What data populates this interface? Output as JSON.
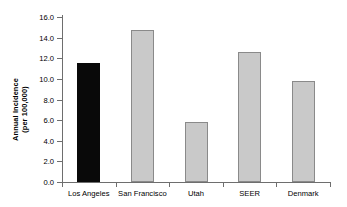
{
  "chart_data": {
    "type": "bar",
    "title": "",
    "xlabel": "",
    "ylabel": "Annual Incidence (per 100,000)",
    "ylabel_line1": "Annual Incidence",
    "ylabel_line2": "(per 100,000)",
    "categories": [
      "Los Angeles",
      "San Francisco",
      "Utah",
      "SEER",
      "Denmark"
    ],
    "values": [
      11.5,
      14.7,
      5.8,
      12.6,
      9.8
    ],
    "series": [
      {
        "name": "Annual Incidence (per 100,000)",
        "values": [
          11.5,
          14.7,
          5.8,
          12.6,
          9.8
        ]
      }
    ],
    "highlighted_category": "Los Angeles",
    "bar_colors": [
      "#090909",
      "#c9c9c9",
      "#c9c9c9",
      "#c9c9c9",
      "#c9c9c9"
    ],
    "bar_border_color": "#8a8a8a",
    "ylim": [
      0.0,
      16.0
    ],
    "ytick_step": 2.0,
    "ytick_labels": [
      "0.0",
      "2.0",
      "4.0",
      "6.0",
      "8.0",
      "10.0",
      "12.0",
      "14.0",
      "16.0"
    ],
    "ytick_values": [
      0.0,
      2.0,
      4.0,
      6.0,
      8.0,
      10.0,
      12.0,
      14.0,
      16.0
    ],
    "grid": false,
    "legend": false,
    "legend_position": "none",
    "axis_color": "#6e6e6e",
    "background": "#ffffff"
  }
}
